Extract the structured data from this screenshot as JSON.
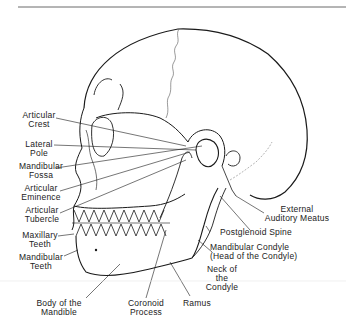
{
  "figure": {
    "type": "anatomical line drawing",
    "line_color": "#1a1a1a",
    "background": "#ffffff"
  },
  "labels_left": [
    {
      "id": "articular-crest",
      "line1": "Articular",
      "line2": "Crest"
    },
    {
      "id": "lateral-pole",
      "line1": "Lateral",
      "line2": "Pole"
    },
    {
      "id": "mandibular-fossa",
      "line1": "Mandibular",
      "line2": "Fossa"
    },
    {
      "id": "articular-eminence",
      "line1": "Articular",
      "line2": "Eminence"
    },
    {
      "id": "articular-tubercle",
      "line1": "Articular",
      "line2": "Tubercle"
    },
    {
      "id": "maxillary-teeth",
      "line1": "Maxillary",
      "line2": "Teeth"
    },
    {
      "id": "mandibular-teeth",
      "line1": "Mandibular",
      "line2": "Teeth"
    }
  ],
  "labels_bottom": [
    {
      "id": "body-of-mandible",
      "line1": "Body of the",
      "line2": "Mandible"
    },
    {
      "id": "coronoid-process",
      "line1": "Coronoid",
      "line2": "Process"
    },
    {
      "id": "ramus",
      "line1": "Ramus",
      "line2": ""
    }
  ],
  "labels_right": [
    {
      "id": "external-auditory-meatus",
      "line1": "External",
      "line2": "Auditory Meatus"
    },
    {
      "id": "postglenoid-spine",
      "line1": "Postglenoid Spine",
      "line2": ""
    },
    {
      "id": "mandibular-condyle",
      "line1": "Mandibular Condyle",
      "line2": "(Head of the Condyle)"
    },
    {
      "id": "neck-of-condyle",
      "line1": "Neck of",
      "line2": "the",
      "line3": "Condyle"
    }
  ]
}
